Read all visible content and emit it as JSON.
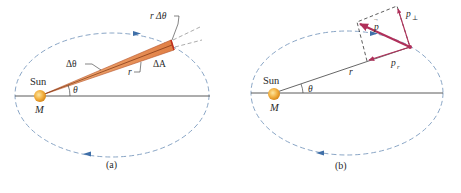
{
  "figure": {
    "panels": [
      {
        "id": "a",
        "caption": "(a)",
        "labels": {
          "sun": "Sun",
          "mass": "M",
          "angle": "θ",
          "delta_theta": "Δθ",
          "r_delta_theta": "r Δθ",
          "radius": "r",
          "delta_area": "ΔA"
        }
      },
      {
        "id": "b",
        "caption": "(b)",
        "labels": {
          "sun": "Sun",
          "mass": "M",
          "angle": "θ",
          "radius": "r",
          "momentum": "p",
          "momentum_arrow": "→",
          "p_radial": "p",
          "p_radial_sub": "r",
          "p_perp": "p",
          "p_perp_sub": "⊥"
        }
      }
    ],
    "colors": {
      "orbit": "#7a9cc0",
      "orbit_arrow": "#3f6fa8",
      "axis": "#555555",
      "sun": "#f0a830",
      "wedge": "#e8925a",
      "wedge_edge": "#b5532a",
      "momentum": "#b0305a",
      "dashed": "#333333"
    }
  }
}
